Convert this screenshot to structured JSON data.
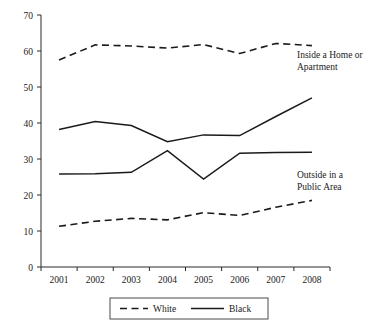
{
  "chart_data": {
    "type": "line",
    "title": "",
    "subtitle": "",
    "xlabel": "",
    "ylabel": "",
    "x": [
      "2001",
      "2002",
      "2003",
      "2004",
      "2005",
      "2006",
      "2007",
      "2008"
    ],
    "categories": [
      "2001",
      "2002",
      "2003",
      "2004",
      "2005",
      "2006",
      "2007",
      "2008"
    ],
    "ylim": [
      0,
      70
    ],
    "yticks": [
      0,
      10,
      20,
      30,
      40,
      50,
      60,
      70
    ],
    "ytick_labels": [
      "0",
      "10",
      "20",
      "30",
      "40",
      "50",
      "60",
      "70"
    ],
    "xtick_labels": [
      "2001",
      "2002",
      "2003",
      "2004",
      "2005",
      "2006",
      "2007",
      "2008"
    ],
    "grid": false,
    "legend_position": "bottom-center",
    "series": [
      {
        "name": "White",
        "group": "Inside a Home or Apartment",
        "style": "dashed",
        "color": "#1a1a1a",
        "values": [
          57.5,
          61.7,
          61.4,
          60.8,
          61.8,
          59.3,
          62.1,
          61.5
        ]
      },
      {
        "name": "Black",
        "group": "Inside a Home or Apartment",
        "style": "solid",
        "color": "#1a1a1a",
        "values": [
          38.2,
          40.4,
          39.3,
          34.8,
          36.7,
          36.5,
          41.8,
          47.0
        ]
      },
      {
        "name": "Black",
        "group": "Outside in a Public Area",
        "style": "solid",
        "color": "#1a1a1a",
        "values": [
          25.8,
          25.9,
          26.3,
          32.3,
          24.4,
          31.6,
          31.8,
          31.9
        ]
      },
      {
        "name": "White",
        "group": "Outside in a Public Area",
        "style": "dashed",
        "color": "#1a1a1a",
        "values": [
          11.3,
          12.7,
          13.5,
          13.1,
          15.1,
          14.3,
          16.6,
          18.5
        ]
      }
    ],
    "annotations": [
      {
        "text_line1": "Inside a Home or",
        "text_line2": "Apartment"
      },
      {
        "text_line1": "Outside in a",
        "text_line2": "Public Area"
      }
    ],
    "legend": [
      {
        "label": "White",
        "style": "dashed"
      },
      {
        "label": "Black",
        "style": "solid"
      }
    ]
  }
}
